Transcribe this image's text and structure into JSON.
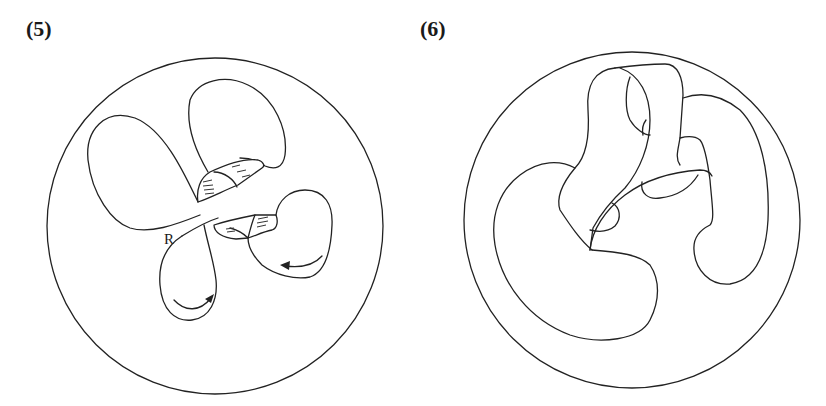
{
  "figure": {
    "panels": [
      {
        "id": "panel-5",
        "label": "(5)",
        "annotations": [
          {
            "text": "R"
          }
        ],
        "arrows": 2
      },
      {
        "id": "panel-6",
        "label": "(6)",
        "annotations": []
      }
    ]
  },
  "colors": {
    "line": "#222222",
    "background": "#ffffff"
  }
}
